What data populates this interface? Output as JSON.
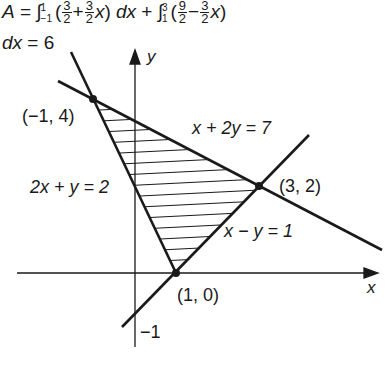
{
  "formula": {
    "lhs": "A",
    "eq": "=",
    "integral1": {
      "upper": "1",
      "lower": "−1",
      "term1_num": "3",
      "term1_den": "2",
      "op": "+",
      "term2_num": "3",
      "term2_den": "2",
      "var": "x",
      "dx": "dx"
    },
    "plus": "+",
    "integral2": {
      "upper": "3",
      "lower": "1",
      "term1_num": "9",
      "term1_den": "2",
      "op": "−",
      "term2_num": "3",
      "term2_den": "2",
      "var": "x"
    },
    "line2_dx": "dx",
    "line2_result": "= 6"
  },
  "axes": {
    "x_label": "x",
    "y_label": "y",
    "y_intercept_label": "−1"
  },
  "lines": [
    {
      "equation": "x + 2y = 7"
    },
    {
      "equation": "2x + y = 2"
    },
    {
      "equation": "x − y = 1"
    }
  ],
  "points": [
    {
      "label": "(−1, 4)",
      "x": -1,
      "y": 4
    },
    {
      "label": "(3, 2)",
      "x": 3,
      "y": 2
    },
    {
      "label": "(1, 0)",
      "x": 1,
      "y": 0
    }
  ],
  "region": {
    "description": "shaded triangle with vertices (−1,4), (3,2), (1,0)",
    "area": 6
  },
  "colors": {
    "ink": "#1a1a1a",
    "background": "#ffffff"
  }
}
